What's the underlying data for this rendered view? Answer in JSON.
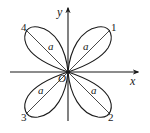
{
  "diagram": {
    "type": "polar-rose",
    "colors": {
      "stroke": "#1a1a1a",
      "background": "#ffffff"
    },
    "axes": {
      "x_label": "x",
      "y_label": "y",
      "origin_label": "O"
    },
    "petals": [
      {
        "id": "1",
        "label": "1",
        "segment_label": "a",
        "direction": "upper-right"
      },
      {
        "id": "2",
        "label": "2",
        "segment_label": "a",
        "direction": "lower-right"
      },
      {
        "id": "3",
        "label": "3",
        "segment_label": "a",
        "direction": "lower-left"
      },
      {
        "id": "4",
        "label": "4",
        "segment_label": "a",
        "direction": "upper-left"
      }
    ]
  }
}
